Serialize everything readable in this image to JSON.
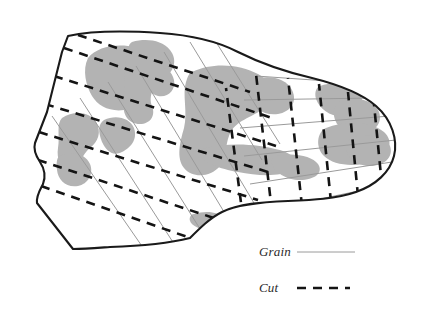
{
  "figure": {
    "kind": "hide-cutting-layout-diagram",
    "background_color": "#ffffff",
    "outline_color": "#1a1a1a",
    "defect_fill_color": "#b3b3b3",
    "grain_line_color": "#9a9a9a",
    "cut_line_color": "#141414"
  },
  "legend": {
    "items": [
      {
        "label": "Grain",
        "style": "solid-thin",
        "color": "#9a9a9a",
        "sample_x1": 297,
        "sample_x2": 355,
        "sample_y": 252,
        "label_x": 259,
        "label_y": 256
      },
      {
        "label": "Cut",
        "style": "dashed-bold",
        "color": "#141414",
        "sample_x1": 297,
        "sample_x2": 350,
        "sample_y": 288,
        "label_x": 259,
        "label_y": 292,
        "dash_pattern": "9 7"
      }
    ]
  },
  "hide_outline": {
    "path": "M 68 36 C 95 30, 130 31, 160 33 C 190 35, 215 40, 238 52 C 262 64, 286 72, 312 78 C 336 84, 360 92, 376 106 C 392 120, 398 140, 394 156 C 390 172, 376 185, 356 192 C 336 199, 312 200, 288 201 C 262 202, 238 204, 222 212 C 210 218, 200 228, 190 238 C 170 243, 140 246, 110 247 C 96 248, 84 249, 73 249 L 37 203 C 36 196, 40 190, 43 184 C 46 176, 44 168, 40 162 C 36 156, 33 150, 35 143 L 47 112 C 52 92, 58 68, 62 52 Z",
    "stroke_width": 2.1
  },
  "regions": {
    "left_diagonal": {
      "description": "left region with steep diagonal grain lines and shallower diagonal cut lines",
      "grain_angle_deg": 62,
      "cut_angle_deg": 28
    },
    "right_orthogonal": {
      "description": "right region with near-horizontal grain lines and near-vertical cut lines",
      "grain_angle_deg": 6,
      "cut_angle_deg": 80
    }
  },
  "grain_lines_left": [
    "M 52 116 L 146 252",
    "M 80 98 L 178 250",
    "M 108 82 L 212 248",
    "M 136 66 L 244 245",
    "M 164 52 L 276 240",
    "M 190 42 L 262 160",
    "M 216 42 L 280 144"
  ],
  "cut_lines_left": [
    "M 41 186 L 196 240",
    "M 38 160 L 232 224",
    "M 39 132 L 258 200",
    "M 45 104 L 268 172",
    "M 54 76 L 276 146",
    "M 64 48 L 272 118",
    "M 78 35 L 250 92"
  ],
  "grain_lines_right": [
    "M 258 212 L 382 186",
    "M 250 184 L 392 162",
    "M 244 156 L 396 140",
    "M 240 128 L 390 116",
    "M 244 100 L 374 98",
    "M 256 76 L 342 82"
  ],
  "cut_lines_right": [
    "M 243 218 L 226 88",
    "M 272 212 L 256 74",
    "M 302 206 L 288 78",
    "M 331 202 L 319 84",
    "M 358 196 L 348 92",
    "M 382 186 L 374 104"
  ],
  "defects": [
    {
      "name": "defect-upper-left",
      "path": "M 88 58 C 96 48, 112 44, 128 46 C 142 48, 152 56, 150 66 C 148 76, 138 80, 140 90 C 142 100, 136 108, 124 110 C 110 112, 98 106, 92 96 C 86 86, 82 70, 88 58 Z"
    },
    {
      "name": "defect-upper-mid",
      "path": "M 132 42 C 146 38, 162 40, 170 50 C 178 60, 174 72, 164 78 C 154 84, 148 96, 152 106 C 156 116, 150 124, 140 124 C 128 124, 122 114, 124 102 C 126 88, 122 74, 126 60 C 128 50, 128 44, 132 42 Z"
    },
    {
      "name": "defect-upper-right-small",
      "path": "M 152 68 C 162 64, 172 70, 174 80 C 176 90, 168 98, 158 96 C 150 94, 146 86, 148 78 C 149 72, 150 69, 152 68 Z"
    },
    {
      "name": "defect-mid-left",
      "path": "M 62 118 C 74 110, 90 112, 96 122 C 102 132, 98 142, 90 148 C 82 154, 80 166, 72 168 C 62 170, 56 160, 58 148 C 60 136, 56 124, 62 118 Z"
    },
    {
      "name": "defect-mid-center",
      "path": "M 104 120 C 116 114, 130 118, 134 128 C 138 140, 130 148, 122 152 C 112 157, 106 150, 102 142 C 98 132, 98 124, 104 120 Z"
    },
    {
      "name": "defect-lower-left-blob",
      "path": "M 60 156 C 72 150, 86 154, 90 164 C 94 174, 88 184, 78 186 C 66 188, 58 180, 57 170 C 56 162, 57 157, 60 156 Z"
    },
    {
      "name": "defect-center-large",
      "path": "M 192 72 C 212 62, 240 64, 258 74 C 272 82, 276 94, 268 104 C 258 116, 240 118, 232 130 C 224 142, 228 156, 220 166 C 210 178, 192 178, 184 168 C 176 158, 180 142, 184 128 C 188 112, 182 94, 186 82 C 188 76, 189 73, 192 72 Z"
    },
    {
      "name": "defect-center-right",
      "path": "M 252 80 C 268 74, 286 78, 292 90 C 298 102, 290 112, 278 114 C 264 116, 252 108, 248 96 C 245 87, 248 82, 252 80 Z"
    },
    {
      "name": "defect-center-band",
      "path": "M 206 148 C 230 142, 258 144, 280 150 C 296 155, 302 164, 292 170 C 280 177, 258 176, 238 172 C 220 169, 202 162, 200 155 C 199 151, 202 149, 206 148 Z"
    },
    {
      "name": "defect-center-tail",
      "path": "M 276 156 C 294 152, 312 156, 318 164 C 324 173, 314 180, 300 180 C 286 180, 274 172, 272 164 C 271 159, 273 157, 276 156 Z"
    },
    {
      "name": "defect-right-upper",
      "path": "M 320 86 C 336 80, 354 84, 360 94 C 366 104, 358 114, 346 116 C 332 118, 320 110, 316 99 C 314 91, 317 87, 320 86 Z"
    },
    {
      "name": "defect-right-mid",
      "path": "M 342 100 C 356 96, 372 100, 378 110 C 384 121, 376 132, 362 134 C 348 136, 336 128, 334 116 C 333 106, 338 101, 342 100 Z"
    },
    {
      "name": "defect-right-lower",
      "path": "M 326 128 C 346 120, 372 122, 384 132 C 394 141, 390 154, 376 160 C 358 168, 334 166, 324 156 C 315 147, 317 132, 326 128 Z"
    },
    {
      "name": "defect-right-tip",
      "path": "M 352 138 C 368 132, 386 136, 390 146 C 394 157, 384 166, 370 166 C 356 166, 346 157, 346 147 C 346 142, 349 139, 352 138 Z"
    },
    {
      "name": "defect-bottom-small",
      "path": "M 194 214 C 206 210, 220 212, 222 218 C 224 225, 214 230, 204 229 C 194 228, 188 222, 190 217 C 191 215, 192 214, 194 214 Z"
    }
  ]
}
